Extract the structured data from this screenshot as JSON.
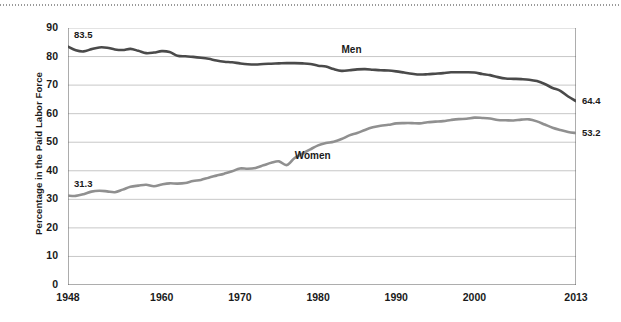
{
  "chart_data": {
    "type": "line",
    "title": "",
    "xlabel": "",
    "ylabel": "Percentage in the Paid Labor Force",
    "ylim": [
      0,
      90
    ],
    "xlim": [
      1948,
      2013
    ],
    "grid": true,
    "legend_position": "inline-annotations",
    "yticks": [
      "90",
      "80",
      "70",
      "60",
      "50",
      "40",
      "30",
      "20",
      "10",
      "0"
    ],
    "ytick_values": [
      90,
      80,
      70,
      60,
      50,
      40,
      30,
      20,
      10,
      0
    ],
    "xticks": [
      "1948",
      "1960",
      "1970",
      "1980",
      "1990",
      "2000",
      "2013"
    ],
    "xtick_values": [
      1948,
      1960,
      1970,
      1980,
      1990,
      2000,
      2013
    ],
    "x": [
      1948,
      1949,
      1950,
      1951,
      1952,
      1953,
      1954,
      1955,
      1956,
      1957,
      1958,
      1959,
      1960,
      1961,
      1962,
      1963,
      1964,
      1965,
      1966,
      1967,
      1968,
      1969,
      1970,
      1971,
      1972,
      1973,
      1974,
      1975,
      1976,
      1977,
      1978,
      1979,
      1980,
      1981,
      1982,
      1983,
      1984,
      1985,
      1986,
      1987,
      1988,
      1989,
      1990,
      1991,
      1992,
      1993,
      1994,
      1995,
      1996,
      1997,
      1998,
      1999,
      2000,
      2001,
      2002,
      2003,
      2004,
      2005,
      2006,
      2007,
      2008,
      2009,
      2010,
      2011,
      2012,
      2013
    ],
    "series": [
      {
        "name": "Men",
        "color": "#4a4a4a",
        "start_label": "83.5",
        "end_label": "64.4",
        "values": [
          83.5,
          82.2,
          81.8,
          82.6,
          83.2,
          83.1,
          82.5,
          82.3,
          82.7,
          82.0,
          81.2,
          81.4,
          81.9,
          81.6,
          80.3,
          80.1,
          79.9,
          79.6,
          79.2,
          78.6,
          78.2,
          78.0,
          77.6,
          77.3,
          77.2,
          77.4,
          77.5,
          77.6,
          77.7,
          77.7,
          77.6,
          77.4,
          76.8,
          76.5,
          75.6,
          75.0,
          75.2,
          75.5,
          75.6,
          75.4,
          75.2,
          75.1,
          74.8,
          74.4,
          74.0,
          73.7,
          73.8,
          74.0,
          74.2,
          74.5,
          74.5,
          74.5,
          74.4,
          73.9,
          73.5,
          72.8,
          72.3,
          72.2,
          72.1,
          71.9,
          71.4,
          70.4,
          69.0,
          68.0,
          66.0,
          64.4
        ]
      },
      {
        "name": "Women",
        "color": "#909090",
        "start_label": "31.3",
        "end_label": "53.2",
        "values": [
          31.3,
          31.2,
          31.8,
          32.7,
          33.0,
          32.8,
          32.5,
          33.4,
          34.4,
          34.8,
          35.1,
          34.6,
          35.2,
          35.6,
          35.5,
          35.7,
          36.4,
          36.8,
          37.6,
          38.3,
          39.0,
          39.8,
          40.8,
          40.7,
          41.0,
          41.9,
          42.8,
          43.3,
          42.0,
          44.5,
          46.0,
          47.5,
          48.9,
          49.7,
          50.2,
          51.1,
          52.4,
          53.2,
          54.3,
          55.2,
          55.8,
          56.1,
          56.6,
          56.7,
          56.7,
          56.6,
          57.0,
          57.2,
          57.4,
          57.8,
          58.1,
          58.2,
          58.6,
          58.5,
          58.3,
          57.8,
          57.7,
          57.6,
          57.9,
          58.0,
          57.3,
          56.2,
          55.1,
          54.3,
          53.6,
          53.2
        ]
      }
    ],
    "annotations": [
      {
        "text": "Men",
        "near_year": 1983,
        "near_value": 82
      },
      {
        "text": "Women",
        "near_year": 1977,
        "near_value": 45
      }
    ]
  }
}
